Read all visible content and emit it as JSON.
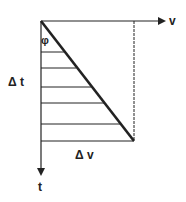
{
  "diagram": {
    "axis_horizontal_label": "v",
    "axis_vertical_label": "t",
    "delta_t_label": "Δ t",
    "delta_v_label": "Δ v",
    "angle_label": "φ",
    "hatch_line_count": 5,
    "stroke_color": "#222222"
  }
}
